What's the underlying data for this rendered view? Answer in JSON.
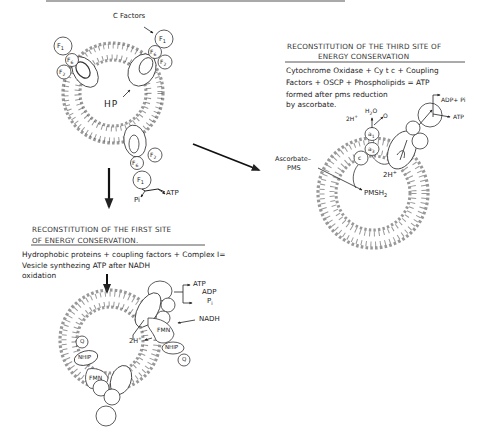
{
  "figure": {
    "top_vesicle": {
      "c_factors_label": "C Factors",
      "hp_label": "HP",
      "subunits": [
        "F1",
        "F6",
        "F2",
        "OSCP"
      ],
      "pi_label": "Pi",
      "atp_label": "ATP"
    },
    "third_site": {
      "title_line1": "RECONSTITUTION OF THE THIRD SITE OF",
      "title_line2": "ENERGY CONSERVATION",
      "desc_line1": "Cytochrome Oxidase + Cy t c + Coupling",
      "desc_line2": "Factors + OSCP + Phospholipids = ATP",
      "desc_line3": "formed after pms reduction",
      "desc_line4": "by ascorbate.",
      "adp_pi_label": "ADP+ Pi",
      "atp_label": "ATP",
      "h2o_label": "H2O",
      "o_label": "O",
      "two_h_top": "2H+",
      "a1_label": "a1",
      "a3_label": "a3",
      "c_label": "c",
      "two_h_inner": "2H+",
      "ascorbate_label_1": "Ascorbate–",
      "ascorbate_label_2": "PMS",
      "pmsh2_label": "PMSH2"
    },
    "first_site": {
      "title_line1": "RECONSTITUTION OF THE FIRST SITE",
      "title_line2": "OF ENERGY CONSERVATION.",
      "desc_line1": "Hydrophobic proteins + coupling factors + Complex I=",
      "desc_line2": "Vesicle synthezing ATP after NADH",
      "desc_line3": "oxidation",
      "atp_label": "ATP",
      "adp_label": "ADP",
      "pi_label": "Pi",
      "nadh_label": "NADH",
      "fmn_label": "FMN",
      "nhip_label": "NHIP",
      "q_label": "Q",
      "two_h_label": "2H+"
    }
  }
}
